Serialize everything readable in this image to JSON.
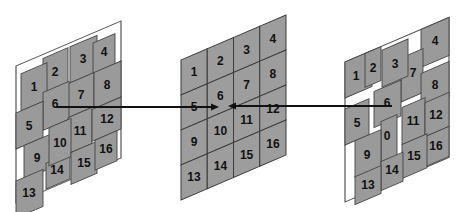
{
  "diagram": {
    "colors": {
      "tile": "#9d9d9d",
      "outline": "#3a3a3a",
      "frame": "#ffffff",
      "text": "#111111",
      "arrow": "#111111"
    },
    "panels": [
      {
        "id": "left",
        "label_kind": "distorted-grid",
        "tiles": [
          "1",
          "2",
          "3",
          "4",
          "5",
          "6",
          "7",
          "8",
          "9",
          "10",
          "11",
          "12",
          "13",
          "14",
          "15",
          "16"
        ]
      },
      {
        "id": "middle",
        "label_kind": "regular-grid",
        "tiles": [
          "1",
          "2",
          "3",
          "4",
          "5",
          "6",
          "7",
          "8",
          "9",
          "10",
          "11",
          "12",
          "13",
          "14",
          "15",
          "16"
        ]
      },
      {
        "id": "right",
        "label_kind": "distorted-grid",
        "tiles": [
          "1",
          "2",
          "3",
          "4",
          "5",
          "6",
          "7",
          "8",
          "9",
          "0",
          "11",
          "12",
          "13",
          "14",
          "15",
          "16"
        ]
      }
    ],
    "arrows": [
      {
        "from": "left panel tile 6",
        "to": "middle panel center",
        "direction": "right"
      },
      {
        "from": "right panel tile 6",
        "to": "middle panel center",
        "direction": "left"
      }
    ]
  }
}
